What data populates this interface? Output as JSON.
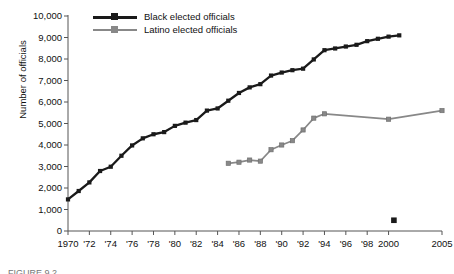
{
  "chart_data": {
    "type": "line",
    "title": "",
    "xlabel": "",
    "ylabel": "Number of officials",
    "xlim": [
      1970,
      2005
    ],
    "ylim": [
      0,
      10000
    ],
    "ytick_step": 1000,
    "grid": false,
    "legend_position": "top-left-inside",
    "y_ticks": [
      "0",
      "1,000",
      "2,000",
      "3,000",
      "4,000",
      "5,000",
      "6,000",
      "7,000",
      "8,000",
      "9,000",
      "10,000"
    ],
    "y_tick_values": [
      0,
      1000,
      2000,
      3000,
      4000,
      5000,
      6000,
      7000,
      8000,
      9000,
      10000
    ],
    "x_ticks": [
      "1970",
      "'72",
      "'74",
      "'76",
      "'78",
      "'80",
      "'82",
      "'84",
      "'86",
      "'88",
      "'90",
      "'92",
      "'94",
      "'96",
      "'98",
      "2000",
      "2005"
    ],
    "x_tick_values": [
      1970,
      1972,
      1974,
      1976,
      1978,
      1980,
      1982,
      1984,
      1986,
      1988,
      1990,
      1992,
      1994,
      1996,
      1998,
      2000,
      2005
    ],
    "series": [
      {
        "name": "Black elected officials",
        "color": "#1a1a1a",
        "marker": "square-filled",
        "x": [
          1970,
          1971,
          1972,
          1973,
          1974,
          1975,
          1976,
          1977,
          1978,
          1979,
          1980,
          1981,
          1982,
          1983,
          1984,
          1985,
          1986,
          1987,
          1988,
          1989,
          1990,
          1991,
          1992,
          1993,
          1994,
          1995,
          1996,
          1997,
          1998,
          1999,
          2000,
          2001
        ],
        "values": [
          1470,
          1860,
          2260,
          2790,
          2990,
          3500,
          3980,
          4310,
          4500,
          4600,
          4890,
          5040,
          5160,
          5600,
          5700,
          6060,
          6420,
          6680,
          6830,
          7230,
          7370,
          7480,
          7550,
          7980,
          8410,
          8490,
          8580,
          8660,
          8830,
          8940,
          9040,
          9100
        ]
      },
      {
        "name": "Latino elected officials",
        "color": "#888888",
        "marker": "square-filled",
        "x": [
          1985,
          1986,
          1987,
          1988,
          1989,
          1990,
          1991,
          1992,
          1993,
          1994,
          2000,
          2005
        ],
        "values": [
          3150,
          3200,
          3300,
          3250,
          3780,
          4000,
          4200,
          4700,
          5250,
          5450,
          5200,
          5600
        ]
      }
    ],
    "annotations": [
      {
        "name": "stray-marker",
        "x": 2000.5,
        "value": 500,
        "color": "#1a1a1a",
        "marker": "square-filled"
      }
    ]
  },
  "legend": {
    "items": [
      {
        "label": "Black elected officials",
        "color": "#1a1a1a"
      },
      {
        "label": "Latino elected officials",
        "color": "#888888"
      }
    ]
  },
  "caption": {
    "sliver": "FIGURE 9.2"
  }
}
